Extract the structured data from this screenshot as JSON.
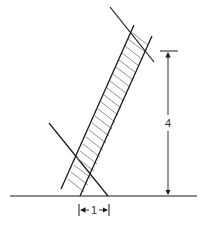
{
  "diagram": {
    "type": "ladder-leaning-against-wall",
    "labels": {
      "height": "4",
      "base": "1"
    },
    "colors": {
      "line": "#1a1a1a",
      "rung": "#888888",
      "background": "#ffffff"
    }
  }
}
